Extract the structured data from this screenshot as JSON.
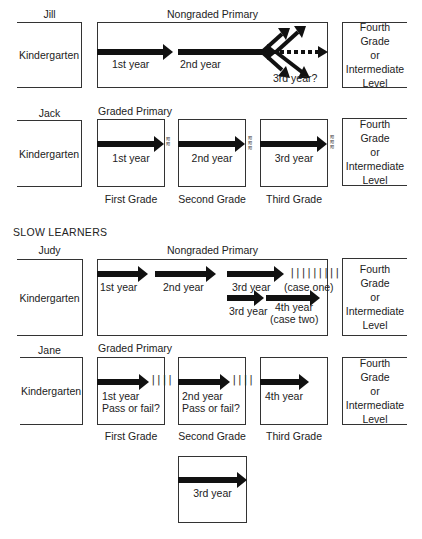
{
  "diagram": {
    "common": {
      "kindergarten": "Kindergarten",
      "fourth_grade": [
        "Fourth",
        "Grade",
        "or",
        "Intermediate",
        "Level"
      ]
    },
    "jill": {
      "name": "Jill",
      "program": "Nongraded Primary",
      "labels": [
        "1st year",
        "2nd year",
        "3rd year?"
      ]
    },
    "jack": {
      "name": "Jack",
      "program": "Graded Primary",
      "years": [
        "1st year",
        "2nd year",
        "3rd year"
      ],
      "grades": [
        "First Grade",
        "Second Grade",
        "Third Grade"
      ]
    },
    "section_title": "SLOW LEARNERS",
    "judy": {
      "name": "Judy",
      "program": "Nongraded Primary",
      "labels": [
        "1st year",
        "2nd year",
        "3rd year",
        "(case one)",
        "3rd year",
        "4th year",
        "(case two)"
      ],
      "hash": "|||||||||"
    },
    "jane": {
      "name": "Jane",
      "program": "Graded Primary",
      "boxes": [
        {
          "line1": "1st year",
          "line2": "Pass or fail?"
        },
        {
          "line1": "2nd year",
          "line2": "Pass or fail?"
        },
        {
          "line1": "4th year",
          "line2": ""
        }
      ],
      "grades": [
        "First Grade",
        "Second Grade",
        "Third Grade"
      ],
      "hash": "||||",
      "repeat_box": "3rd year"
    }
  }
}
